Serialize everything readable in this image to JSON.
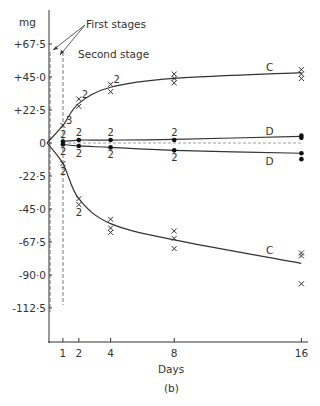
{
  "chart_data": {
    "type": "scatter",
    "title": "",
    "caption": "(b)",
    "xlabel": "Days",
    "ylabel": "mg",
    "x_ticks": [
      1,
      2,
      4,
      8,
      16
    ],
    "y_ticks": [
      "+67·5",
      "+45·0",
      "+22·5",
      "0",
      "-22·5",
      "-45·0",
      "-67·5",
      "-90·0",
      "-112·5"
    ],
    "y_tick_values": [
      67.5,
      45.0,
      22.5,
      0,
      -22.5,
      -45.0,
      -67.5,
      -90.0,
      -112.5
    ],
    "xlim": [
      0,
      16
    ],
    "ylim": [
      -135,
      80
    ],
    "grid": false,
    "annotations": [
      "First stages",
      "Second stage"
    ],
    "series": [
      {
        "name": "C (upper)",
        "marker": "x",
        "curve": [
          [
            0,
            0
          ],
          [
            1,
            12
          ],
          [
            2,
            27
          ],
          [
            4,
            38
          ],
          [
            8,
            44
          ],
          [
            16,
            48
          ]
        ],
        "points": [
          {
            "x": 1,
            "y": 12,
            "count_label": "3"
          },
          {
            "x": 2,
            "y": 30,
            "count_label": "2"
          },
          {
            "x": 2,
            "y": 25
          },
          {
            "x": 4,
            "y": 40,
            "count_label": "2"
          },
          {
            "x": 4,
            "y": 35
          },
          {
            "x": 8,
            "y": 47
          },
          {
            "x": 8,
            "y": 44
          },
          {
            "x": 8,
            "y": 41
          },
          {
            "x": 16,
            "y": 50
          },
          {
            "x": 16,
            "y": 47
          },
          {
            "x": 16,
            "y": 44
          }
        ]
      },
      {
        "name": "D (upper)",
        "marker": "dot",
        "curve": [
          [
            1,
            1
          ],
          [
            2,
            2
          ],
          [
            4,
            2
          ],
          [
            8,
            2.5
          ],
          [
            16,
            4.5
          ]
        ],
        "points": [
          {
            "x": 1,
            "y": 1,
            "count_label": "2"
          },
          {
            "x": 2,
            "y": 2,
            "count_label": "2"
          },
          {
            "x": 4,
            "y": 2,
            "count_label": "2"
          },
          {
            "x": 8,
            "y": 2,
            "count_label": "2"
          },
          {
            "x": 16,
            "y": 5
          },
          {
            "x": 16,
            "y": 3.5
          }
        ]
      },
      {
        "name": "D (lower)",
        "marker": "dot",
        "curve": [
          [
            1,
            -1
          ],
          [
            2,
            -2
          ],
          [
            4,
            -3
          ],
          [
            8,
            -5
          ],
          [
            16,
            -7
          ]
        ],
        "points": [
          {
            "x": 1,
            "y": -1,
            "count_label": "2"
          },
          {
            "x": 2,
            "y": -2,
            "count_label": "2"
          },
          {
            "x": 4,
            "y": -3,
            "count_label": "2"
          },
          {
            "x": 8,
            "y": -5,
            "count_label": "2"
          },
          {
            "x": 16,
            "y": -7
          },
          {
            "x": 16,
            "y": -11
          }
        ]
      },
      {
        "name": "C (lower)",
        "marker": "x",
        "curve": [
          [
            0,
            0
          ],
          [
            1,
            -14
          ],
          [
            2,
            -38
          ],
          [
            4,
            -55
          ],
          [
            8,
            -66
          ],
          [
            16,
            -82
          ]
        ],
        "points": [
          {
            "x": 1,
            "y": -14,
            "count_label": "2"
          },
          {
            "x": 2,
            "y": -38
          },
          {
            "x": 2,
            "y": -42,
            "count_label": "2"
          },
          {
            "x": 4,
            "y": -52
          },
          {
            "x": 4,
            "y": -58
          },
          {
            "x": 4,
            "y": -61
          },
          {
            "x": 8,
            "y": -60
          },
          {
            "x": 8,
            "y": -65
          },
          {
            "x": 8,
            "y": -72
          },
          {
            "x": 16,
            "y": -75
          },
          {
            "x": 16,
            "y": -77
          },
          {
            "x": 16,
            "y": -96
          }
        ]
      }
    ],
    "curve_labels": [
      {
        "text": "C",
        "x": 14,
        "y": 52
      },
      {
        "text": "D",
        "x": 14,
        "y": 8
      },
      {
        "text": "D",
        "x": 14,
        "y": -12
      },
      {
        "text": "C",
        "x": 14,
        "y": -73
      }
    ],
    "reference_lines": [
      {
        "type": "vertical-dashed",
        "x": 0.15,
        "label": "First stages"
      },
      {
        "type": "vertical-dashed",
        "x": 1,
        "label": "First stages"
      },
      {
        "type": "horizontal-dashed",
        "y": 0
      }
    ]
  },
  "labels": {
    "y_unit": "mg",
    "x_axis": "Days",
    "caption": "(b)",
    "first_stages": "First stages",
    "second_stage": "Second stage",
    "curve_c": "C",
    "curve_d": "D"
  }
}
